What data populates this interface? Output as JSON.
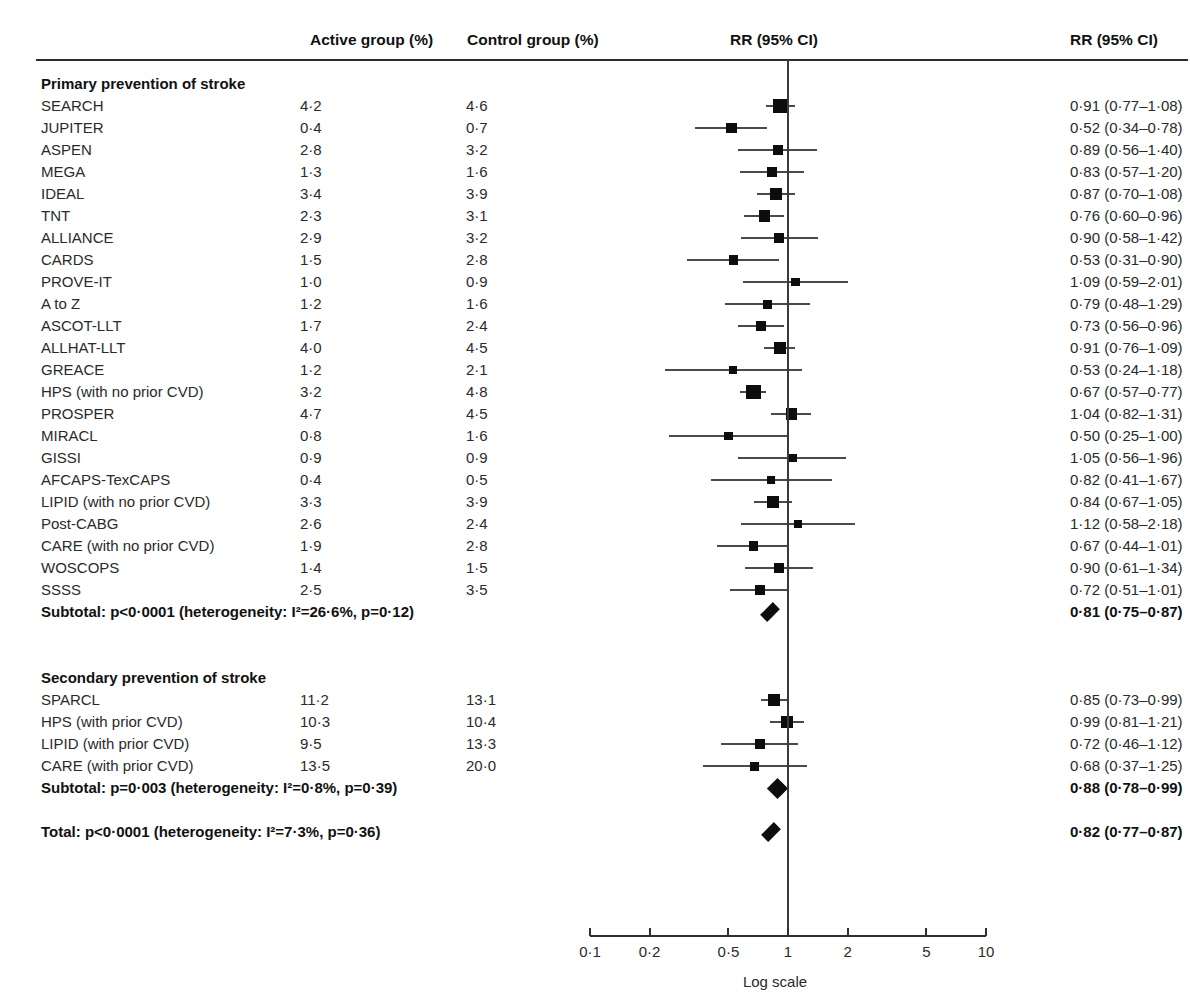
{
  "header": {
    "active_group": "Active group (%)",
    "control_group": "Control group (%)",
    "rr_plot": "RR (95% CI)",
    "rr_text": "RR (95% CI)"
  },
  "axis": {
    "title": "Log scale",
    "ticks": [
      "0·1",
      "0·2",
      "0·5",
      "1",
      "2",
      "5",
      "10"
    ],
    "tick_values": [
      0.1,
      0.2,
      0.5,
      1,
      2,
      5,
      10
    ],
    "scale": "log",
    "xmin": 0.1,
    "xmax": 10,
    "reference": 1
  },
  "colors": {
    "marker": "#0d0d0d",
    "line": "#4a4a4a",
    "rule": "#2b2b2b",
    "text": "#2a2a2a"
  },
  "chart_data": {
    "type": "forest",
    "title": "",
    "xlabel": "Log scale",
    "ylabel": "",
    "xscale": "log",
    "xlim": [
      0.1,
      10
    ],
    "reference_line": 1,
    "columns": [
      "Study",
      "Active group (%)",
      "Control group (%)",
      "RR (95% CI)"
    ],
    "groups": [
      {
        "name": "Primary prevention of stroke",
        "rows": [
          {
            "label": "SEARCH",
            "active": "4·2",
            "control": "4·6",
            "rr_text": "0·91 (0·77–1·08)",
            "rr": 0.91,
            "lo": 0.77,
            "hi": 1.08,
            "weight": 7.0
          },
          {
            "label": "JUPITER",
            "active": "0·4",
            "control": "0·7",
            "rr_text": "0·52 (0·34–0·78)",
            "rr": 0.52,
            "lo": 0.34,
            "hi": 0.78,
            "weight": 5.2
          },
          {
            "label": "ASPEN",
            "active": "2·8",
            "control": "3·2",
            "rr_text": "0·89 (0·56–1·40)",
            "rr": 0.89,
            "lo": 0.56,
            "hi": 1.4,
            "weight": 4.2
          },
          {
            "label": "MEGA",
            "active": "1·3",
            "control": "1·6",
            "rr_text": "0·83 (0·57–1·20)",
            "rr": 0.83,
            "lo": 0.57,
            "hi": 1.2,
            "weight": 4.8
          },
          {
            "label": "IDEAL",
            "active": "3·4",
            "control": "3·9",
            "rr_text": "0·87 (0·70–1·08)",
            "rr": 0.87,
            "lo": 0.7,
            "hi": 1.08,
            "weight": 6.2
          },
          {
            "label": "TNT",
            "active": "2·3",
            "control": "3·1",
            "rr_text": "0·76 (0·60–0·96)",
            "rr": 0.76,
            "lo": 0.6,
            "hi": 0.96,
            "weight": 5.8
          },
          {
            "label": "ALLIANCE",
            "active": "2·9",
            "control": "3·2",
            "rr_text": "0·90 (0·58–1·42)",
            "rr": 0.9,
            "lo": 0.58,
            "hi": 1.42,
            "weight": 4.2
          },
          {
            "label": "CARDS",
            "active": "1·5",
            "control": "2·8",
            "rr_text": "0·53 (0·31–0·90)",
            "rr": 0.53,
            "lo": 0.31,
            "hi": 0.9,
            "weight": 4.4
          },
          {
            "label": "PROVE-IT",
            "active": "1·0",
            "control": "0·9",
            "rr_text": "1·09 (0·59–2·01)",
            "rr": 1.09,
            "lo": 0.59,
            "hi": 2.01,
            "weight": 3.8
          },
          {
            "label": "A to Z",
            "active": "1·2",
            "control": "1·6",
            "rr_text": "0·79 (0·48–1·29)",
            "rr": 0.79,
            "lo": 0.48,
            "hi": 1.29,
            "weight": 4.0
          },
          {
            "label": "ASCOT-LLT",
            "active": "1·7",
            "control": "2·4",
            "rr_text": "0·73 (0·56–0·96)",
            "rr": 0.73,
            "lo": 0.56,
            "hi": 0.96,
            "weight": 5.2
          },
          {
            "label": "ALLHAT-LLT",
            "active": "4·0",
            "control": "4·5",
            "rr_text": "0·91 (0·76–1·09)",
            "rr": 0.91,
            "lo": 0.76,
            "hi": 1.09,
            "weight": 6.4
          },
          {
            "label": "GREACE",
            "active": "1·2",
            "control": "2·1",
            "rr_text": "0·53 (0·24–1·18)",
            "rr": 0.53,
            "lo": 0.24,
            "hi": 1.18,
            "weight": 3.2
          },
          {
            "label": "HPS (with no prior CVD)",
            "active": "3·2",
            "control": "4·8",
            "rr_text": "0·67 (0·57–0·77)",
            "rr": 0.67,
            "lo": 0.57,
            "hi": 0.77,
            "weight": 8.0
          },
          {
            "label": "PROSPER",
            "active": "4·7",
            "control": "4·5",
            "rr_text": "1·04 (0·82–1·31)",
            "rr": 1.04,
            "lo": 0.82,
            "hi": 1.31,
            "weight": 5.8
          },
          {
            "label": "MIRACL",
            "active": "0·8",
            "control": "1·6",
            "rr_text": "0·50 (0·25–1·00)",
            "rr": 0.5,
            "lo": 0.25,
            "hi": 1.0,
            "weight": 3.6
          },
          {
            "label": "GISSI",
            "active": "0·9",
            "control": "0·9",
            "rr_text": "1·05 (0·56–1·96)",
            "rr": 1.05,
            "lo": 0.56,
            "hi": 1.96,
            "weight": 3.8
          },
          {
            "label": "AFCAPS-TexCAPS",
            "active": "0·4",
            "control": "0·5",
            "rr_text": "0·82 (0·41–1·67)",
            "rr": 0.82,
            "lo": 0.41,
            "hi": 1.67,
            "weight": 3.4
          },
          {
            "label": "LIPID (with no prior CVD)",
            "active": "3·3",
            "control": "3·9",
            "rr_text": "0·84 (0·67–1·05)",
            "rr": 0.84,
            "lo": 0.67,
            "hi": 1.05,
            "weight": 5.8
          },
          {
            "label": "Post-CABG",
            "active": "2·6",
            "control": "2·4",
            "rr_text": "1·12 (0·58–2·18)",
            "rr": 1.12,
            "lo": 0.58,
            "hi": 2.18,
            "weight": 3.6
          },
          {
            "label": "CARE (with no prior CVD)",
            "active": "1·9",
            "control": "2·8",
            "rr_text": "0·67 (0·44–1·01)",
            "rr": 0.67,
            "lo": 0.44,
            "hi": 1.01,
            "weight": 4.4
          },
          {
            "label": "WOSCOPS",
            "active": "1·4",
            "control": "1·5",
            "rr_text": "0·90 (0·61–1·34)",
            "rr": 0.9,
            "lo": 0.61,
            "hi": 1.34,
            "weight": 4.6
          },
          {
            "label": "SSSS",
            "active": "2·5",
            "control": "3·5",
            "rr_text": "0·72 (0·51–1·01)",
            "rr": 0.72,
            "lo": 0.51,
            "hi": 1.01,
            "weight": 4.6
          }
        ],
        "summary": {
          "label": "Subtotal: p<0·0001 (heterogeneity: I²=26·6%, p=0·12)",
          "rr_text": "0·81 (0·75–0·87)",
          "rr": 0.81,
          "lo": 0.75,
          "hi": 0.87
        }
      },
      {
        "name": "Secondary prevention of stroke",
        "rows": [
          {
            "label": "SPARCL",
            "active": "11·2",
            "control": "13·1",
            "rr_text": "0·85 (0·73–0·99)",
            "rr": 0.85,
            "lo": 0.73,
            "hi": 0.99,
            "weight": 6.0
          },
          {
            "label": "HPS (with prior CVD)",
            "active": "10·3",
            "control": "10·4",
            "rr_text": "0·99 (0·81–1·21)",
            "rr": 0.99,
            "lo": 0.81,
            "hi": 1.21,
            "weight": 6.0
          },
          {
            "label": "LIPID (with prior CVD)",
            "active": "9·5",
            "control": "13·3",
            "rr_text": "0·72 (0·46–1·12)",
            "rr": 0.72,
            "lo": 0.46,
            "hi": 1.12,
            "weight": 4.4
          },
          {
            "label": "CARE (with prior CVD)",
            "active": "13·5",
            "control": "20·0",
            "rr_text": "0·68 (0·37–1·25)",
            "rr": 0.68,
            "lo": 0.37,
            "hi": 1.25,
            "weight": 4.0
          }
        ],
        "summary": {
          "label": "Subtotal: p=0·003 (heterogeneity: I²=0·8%, p=0·39)",
          "rr_text": "0·88 (0·78–0·99)",
          "rr": 0.88,
          "lo": 0.78,
          "hi": 0.99
        }
      }
    ],
    "total": {
      "label": "Total: p<0·0001 (heterogeneity: I²=7·3%, p=0·36)",
      "rr_text": "0·82 (0·77–0·87)",
      "rr": 0.82,
      "lo": 0.77,
      "hi": 0.87
    }
  }
}
